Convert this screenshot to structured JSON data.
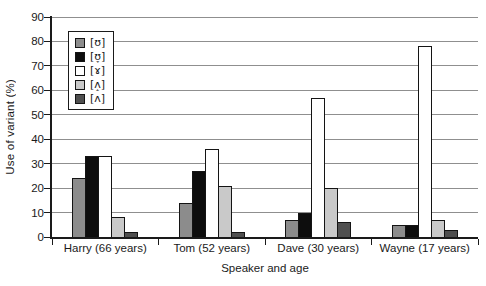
{
  "figure": {
    "background": "#ffffff",
    "text_color": "#1a1a1a",
    "gridline_color": "#8f8f8f",
    "axis_color": "#1a1a1a"
  },
  "chart_data": {
    "type": "bar",
    "title": "",
    "xlabel": "Speaker and age",
    "ylabel": "Use of variant (%)",
    "ylim": [
      0,
      90
    ],
    "ytick_step": 10,
    "yticks": [
      "0",
      "10",
      "20",
      "30",
      "40",
      "50",
      "60",
      "70",
      "80",
      "90"
    ],
    "grid": true,
    "legend_position": "top-left-inside",
    "categories": [
      "Harry (66 years)",
      "Tom (52 years)",
      "Dave (30 years)",
      "Wayne (17 years)"
    ],
    "series": [
      {
        "name": "[ʊ]",
        "color": "#8c8c8c",
        "values": [
          24,
          14,
          7,
          5
        ]
      },
      {
        "name": "[ʊ̞]",
        "color": "#0d0d0d",
        "values": [
          33,
          27,
          10,
          5
        ]
      },
      {
        "name": "[ɤ]",
        "color": "#ffffff",
        "values": [
          33,
          36,
          57,
          78
        ]
      },
      {
        "name": "[ʌ̝]",
        "color": "#c9c9c9",
        "values": [
          8,
          21,
          20,
          7
        ]
      },
      {
        "name": "[ʌ]",
        "color": "#4f4f4f",
        "values": [
          2,
          2,
          6,
          3
        ]
      }
    ]
  }
}
